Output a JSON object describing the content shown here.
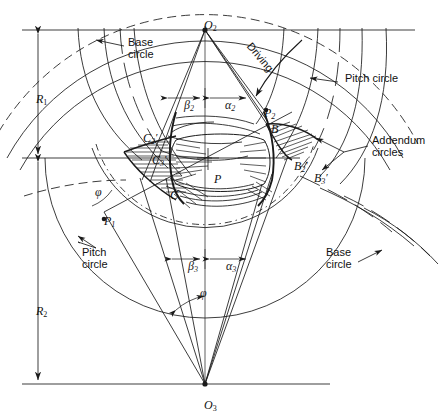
{
  "figure": {
    "background": "#ffffff",
    "line_color": "#1a1a1a",
    "centers": {
      "upper": "O₂",
      "upper_letter": "O",
      "upper_sub": "2",
      "lower_letter": "O",
      "lower_sub": "3"
    },
    "radii": [
      {
        "name": "R1",
        "letter": "R",
        "sub": "1",
        "x": 38,
        "y": 88
      },
      {
        "name": "R2",
        "letter": "R",
        "sub": "2",
        "x": 38,
        "y": 300
      }
    ],
    "callouts": [
      {
        "name": "base-circle-top-left",
        "text": "Base\ncircle",
        "x": 128,
        "y": 42
      },
      {
        "name": "pitch-circle-top-right",
        "text": "Pitch circle",
        "x": 341,
        "y": 77
      },
      {
        "name": "addendum-circles-right",
        "text": "Addendum\ncircles",
        "x": 372,
        "y": 140
      },
      {
        "name": "pitch-circle-bottom-left",
        "text": "Pitch\ncircle",
        "x": 86,
        "y": 252
      },
      {
        "name": "base-circle-bottom-right",
        "text": "Base\ncircle",
        "x": 330,
        "y": 252
      },
      {
        "name": "driving-arrow-label",
        "text": "Driving",
        "x": 265,
        "y": 47
      }
    ],
    "points": [
      {
        "name": "point-P",
        "letter": "P",
        "sub": "",
        "prime": "",
        "x": 212,
        "y": 166
      },
      {
        "name": "point-P2",
        "letter": "P",
        "sub": "2",
        "prime": "",
        "x": 262,
        "y": 103
      },
      {
        "name": "point-P1",
        "letter": "P",
        "sub": "1",
        "prime": "",
        "x": 104,
        "y": 211
      },
      {
        "name": "point-B",
        "letter": "B",
        "sub": "",
        "prime": "",
        "x": 268,
        "y": 118
      },
      {
        "name": "point-B2-prime",
        "letter": "B",
        "sub": "2",
        "prime": "′",
        "x": 292,
        "y": 152
      },
      {
        "name": "point-B3-prime",
        "letter": "B",
        "sub": "3",
        "prime": "′",
        "x": 311,
        "y": 165
      },
      {
        "name": "point-C",
        "letter": "C",
        "sub": "",
        "prime": "",
        "x": 168,
        "y": 182
      },
      {
        "name": "point-C2-prime",
        "letter": "C",
        "sub": "2",
        "prime": "′",
        "x": 143,
        "y": 125
      },
      {
        "name": "point-C3-prime",
        "letter": "C",
        "sub": "3",
        "prime": "′",
        "x": 152,
        "y": 147
      }
    ],
    "angles": [
      {
        "name": "angle-beta2",
        "glyph": "β",
        "sub": "2",
        "x": 182,
        "y": 92
      },
      {
        "name": "angle-alpha2",
        "glyph": "α",
        "sub": "2",
        "x": 223,
        "y": 92
      },
      {
        "name": "angle-beta3",
        "glyph": "β",
        "sub": "3",
        "x": 186,
        "y": 253
      },
      {
        "name": "angle-alpha3",
        "glyph": "α",
        "sub": "3",
        "x": 224,
        "y": 253
      },
      {
        "name": "angle-phi-upper",
        "glyph": "φ",
        "sub": "",
        "x": 99,
        "y": 192
      },
      {
        "name": "angle-phi-lower",
        "glyph": "φ",
        "sub": "",
        "x": 204,
        "y": 293
      }
    ]
  }
}
